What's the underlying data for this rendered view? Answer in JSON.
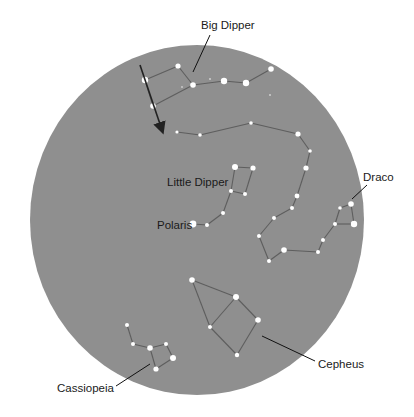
{
  "colors": {
    "sky": "#8f8f8f",
    "background": "#ffffff",
    "star": "#ffffff",
    "line": "#5e5e5e",
    "label": "#1a1a1a",
    "arrow": "#222222"
  },
  "sky_disc": {
    "cx": 197,
    "cy": 220,
    "rx": 167,
    "ry": 175
  },
  "labels": {
    "big_dipper": "Big Dipper",
    "little_dipper": "Little Dipper",
    "polaris": "Polaris",
    "draco": "Draco",
    "cepheus": "Cepheus",
    "cassiopeia": "Cassiopeia"
  },
  "constellations": [
    {
      "name": "Big Dipper",
      "stars": [
        [
          145,
          80,
          3.2
        ],
        [
          178,
          66,
          2.6
        ],
        [
          193,
          85,
          2.8
        ],
        [
          224,
          81,
          3.2
        ],
        [
          246,
          83,
          3.2
        ],
        [
          271,
          69,
          2.8
        ],
        [
          153,
          106,
          2.8
        ]
      ],
      "lines": [
        [
          0,
          1
        ],
        [
          1,
          2
        ],
        [
          2,
          3
        ],
        [
          3,
          4
        ],
        [
          4,
          5
        ],
        [
          2,
          6
        ],
        [
          6,
          0
        ]
      ]
    },
    {
      "name": "Draco",
      "stars": [
        [
          177,
          132,
          1.6
        ],
        [
          200,
          135,
          1.8
        ],
        [
          251,
          123,
          1.8
        ],
        [
          298,
          134,
          2.6
        ],
        [
          310,
          151,
          1.8
        ],
        [
          306,
          168,
          2.6
        ],
        [
          297,
          196,
          2.4
        ],
        [
          292,
          208,
          2.0
        ],
        [
          274,
          218,
          2.0
        ],
        [
          259,
          236,
          2.0
        ],
        [
          269,
          261,
          2.0
        ],
        [
          284,
          250,
          2.8
        ],
        [
          318,
          252,
          2.0
        ],
        [
          323,
          240,
          2.0
        ],
        [
          335,
          224,
          2.0
        ],
        [
          340,
          208,
          1.8
        ],
        [
          351,
          204,
          2.8
        ],
        [
          354,
          224,
          3.2
        ]
      ],
      "lines": [
        [
          0,
          1
        ],
        [
          1,
          2
        ],
        [
          2,
          3
        ],
        [
          3,
          4
        ],
        [
          4,
          5
        ],
        [
          5,
          6
        ],
        [
          6,
          7
        ],
        [
          7,
          8
        ],
        [
          8,
          9
        ],
        [
          9,
          10
        ],
        [
          10,
          11
        ],
        [
          11,
          12
        ],
        [
          12,
          13
        ],
        [
          13,
          14
        ],
        [
          14,
          15
        ],
        [
          15,
          16
        ],
        [
          16,
          17
        ],
        [
          17,
          14
        ]
      ]
    },
    {
      "name": "Little Dipper",
      "stars": [
        [
          235,
          167,
          3.0
        ],
        [
          253,
          168,
          2.6
        ],
        [
          231,
          191,
          2.0
        ],
        [
          245,
          194,
          2.0
        ],
        [
          223,
          213,
          2.0
        ],
        [
          207,
          225,
          2.0
        ],
        [
          193,
          224,
          3.4
        ]
      ],
      "lines": [
        [
          0,
          1
        ],
        [
          1,
          3
        ],
        [
          3,
          2
        ],
        [
          2,
          0
        ],
        [
          2,
          4
        ],
        [
          4,
          5
        ],
        [
          5,
          6
        ]
      ]
    },
    {
      "name": "Cepheus",
      "stars": [
        [
          192,
          280,
          2.8
        ],
        [
          236,
          297,
          3.0
        ],
        [
          258,
          320,
          2.8
        ],
        [
          210,
          327,
          2.0
        ],
        [
          237,
          355,
          2.2
        ]
      ],
      "lines": [
        [
          0,
          1
        ],
        [
          1,
          2
        ],
        [
          2,
          4
        ],
        [
          4,
          3
        ],
        [
          3,
          1
        ],
        [
          3,
          0
        ]
      ]
    },
    {
      "name": "Cassiopeia",
      "stars": [
        [
          127,
          325,
          2.0
        ],
        [
          133,
          344,
          2.0
        ],
        [
          150,
          348,
          2.8
        ],
        [
          166,
          344,
          2.0
        ],
        [
          173,
          358,
          3.0
        ],
        [
          156,
          369,
          2.6
        ]
      ],
      "lines": [
        [
          0,
          1
        ],
        [
          1,
          2
        ],
        [
          2,
          3
        ],
        [
          3,
          4
        ],
        [
          4,
          5
        ],
        [
          5,
          2
        ]
      ]
    }
  ],
  "faint_stars": [
    [
      210,
      79,
      1.0
    ],
    [
      182,
      87,
      0.9
    ],
    [
      270,
      95,
      1.0
    ]
  ],
  "arrow": {
    "x1": 140,
    "y1": 65,
    "x2": 162,
    "y2": 130
  }
}
